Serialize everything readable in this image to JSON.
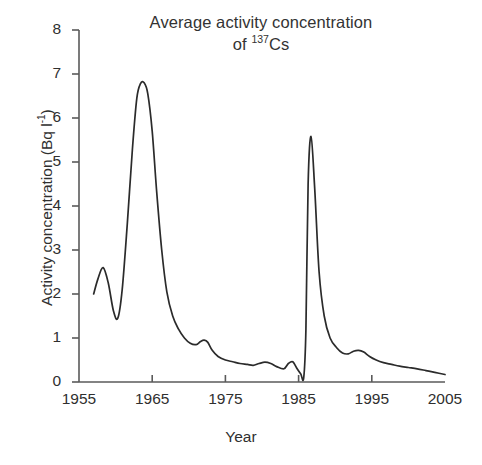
{
  "chart_data": {
    "type": "line",
    "title_line1": "Average activity concentration",
    "title_line2_prefix": "of ",
    "title_line2_sup": "137",
    "title_line2_suffix": "Cs",
    "xlabel": "Year",
    "ylabel": "Activity concentration (Bq l⁻¹)",
    "ylabel_prefix": "Activity concentration (Bq l",
    "ylabel_sup": "-1",
    "ylabel_suffix": ")",
    "xlim": [
      1955,
      2005
    ],
    "ylim": [
      0,
      8
    ],
    "grid": false,
    "legend": null,
    "xticks": [
      1955,
      1965,
      1975,
      1985,
      1995,
      2005
    ],
    "xtick_labels": [
      "1955",
      "1965",
      "1975",
      "1985",
      "1995",
      "2005"
    ],
    "yticks": [
      0,
      1,
      2,
      3,
      4,
      5,
      6,
      7,
      8
    ],
    "ytick_labels": [
      "0",
      "1",
      "2",
      "3",
      "4",
      "5",
      "6",
      "7",
      "8"
    ],
    "line_color": "#2b2b2b",
    "axis_color": "#5a5a5a",
    "series": [
      {
        "name": "Average activity concentration of 137Cs",
        "x": [
          1957.0,
          1957.6,
          1958.3,
          1959.0,
          1959.7,
          1960.3,
          1960.9,
          1961.6,
          1962.3,
          1962.9,
          1963.4,
          1963.9,
          1964.4,
          1965.0,
          1965.6,
          1966.3,
          1967.0,
          1967.8,
          1968.6,
          1969.4,
          1970.2,
          1971.0,
          1971.6,
          1972.1,
          1972.6,
          1973.2,
          1974.0,
          1975.0,
          1976.0,
          1977.0,
          1978.0,
          1978.8,
          1979.6,
          1980.4,
          1981.2,
          1982.0,
          1983.0,
          1983.6,
          1984.2,
          1984.8,
          1985.3,
          1985.7,
          1986.0,
          1986.3,
          1986.7,
          1987.2,
          1987.8,
          1988.5,
          1989.3,
          1990.2,
          1991.0,
          1991.8,
          1992.5,
          1993.2,
          1993.9,
          1994.7,
          1995.6,
          1996.6,
          1997.7,
          1998.8,
          2000.0,
          2001.2,
          2002.4,
          2003.6,
          2005.0
        ],
        "y": [
          2.0,
          2.35,
          2.6,
          2.25,
          1.62,
          1.45,
          2.1,
          3.6,
          5.3,
          6.45,
          6.78,
          6.8,
          6.55,
          5.7,
          4.35,
          3.0,
          2.05,
          1.5,
          1.2,
          1.0,
          0.88,
          0.85,
          0.92,
          0.95,
          0.9,
          0.72,
          0.58,
          0.5,
          0.46,
          0.42,
          0.4,
          0.38,
          0.42,
          0.45,
          0.42,
          0.35,
          0.3,
          0.42,
          0.46,
          0.3,
          0.18,
          0.1,
          1.2,
          4.5,
          5.58,
          4.4,
          2.5,
          1.5,
          1.0,
          0.78,
          0.66,
          0.64,
          0.7,
          0.72,
          0.68,
          0.58,
          0.5,
          0.44,
          0.4,
          0.36,
          0.33,
          0.3,
          0.26,
          0.22,
          0.17
        ]
      }
    ],
    "annotations": [
      {
        "label_peak_1_year": 1964,
        "label_peak_1_value": 6.8
      },
      {
        "label_peak_2_year": 1986,
        "label_peak_2_value": 5.6
      }
    ]
  }
}
